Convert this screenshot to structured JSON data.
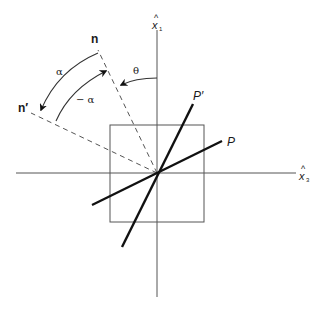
{
  "diagram": {
    "type": "geometric rotation diagram",
    "colors": {
      "line": "#555555",
      "bold_line": "#111111",
      "background": "#ffffff"
    },
    "axes": {
      "vertical": {
        "label_hat": "^",
        "label": "x",
        "subscript": "1"
      },
      "horizontal": {
        "label_hat": "^",
        "label": "x",
        "subscript": "3"
      }
    },
    "lines": {
      "p": {
        "label": "P"
      },
      "p_prime": {
        "label": "P′"
      }
    },
    "normals": {
      "n": {
        "label": "n"
      },
      "n_prime": {
        "label": "n′"
      }
    },
    "angles": {
      "theta": {
        "label": "θ"
      },
      "alpha": {
        "label": "α"
      },
      "minus_alpha": {
        "label": "− α"
      }
    }
  }
}
